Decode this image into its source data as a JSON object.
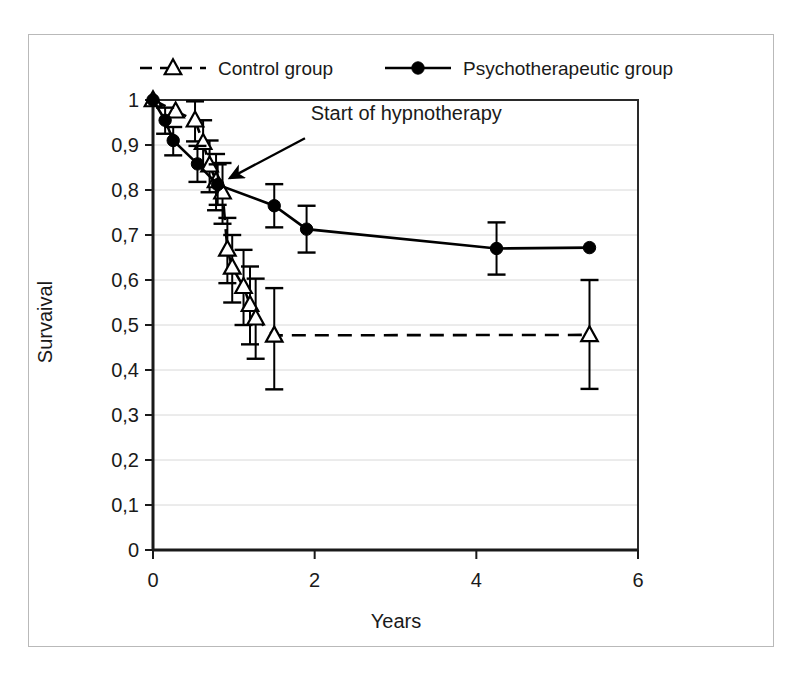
{
  "chart_data": {
    "type": "line",
    "title": "",
    "subtitle": "",
    "xlabel": "Years",
    "ylabel": "Survaival",
    "xlim": [
      0,
      6
    ],
    "ylim": [
      0,
      1
    ],
    "xticks": [
      0,
      2,
      4,
      6
    ],
    "xtick_labels": [
      "0",
      "2",
      "4",
      "6"
    ],
    "yticks": [
      0,
      0.1,
      0.2,
      0.3,
      0.4,
      0.5,
      0.6,
      0.7,
      0.8,
      0.9,
      1
    ],
    "ytick_labels": [
      "0",
      "0,1",
      "0,2",
      "0,3",
      "0,4",
      "0,5",
      "0,6",
      "0,7",
      "0,8",
      "0,9",
      "1"
    ],
    "grid": "horizontal",
    "legend_position": "top",
    "decimal_separator": ",",
    "annotations": [
      {
        "text": "Start of hypnotherapy",
        "text_x": 1.95,
        "text_y": 0.955,
        "arrow_from_x": 1.88,
        "arrow_from_y": 0.915,
        "arrow_to_x": 0.9,
        "arrow_to_y": 0.822
      }
    ],
    "series": [
      {
        "name": "Control group",
        "marker": "open-triangle",
        "line_style": "dashed",
        "color": "#000000",
        "points": [
          {
            "x": 0.0,
            "y": 1.0,
            "err_low": 0.0,
            "err_high": 0.0
          },
          {
            "x": 0.28,
            "y": 0.975,
            "err_low": 0.0,
            "err_high": 0.0
          },
          {
            "x": 0.52,
            "y": 0.955,
            "err_low": 0.047,
            "err_high": 0.042
          },
          {
            "x": 0.62,
            "y": 0.905,
            "err_low": 0.055,
            "err_high": 0.05
          },
          {
            "x": 0.7,
            "y": 0.855,
            "err_low": 0.06,
            "err_high": 0.055
          },
          {
            "x": 0.78,
            "y": 0.82,
            "err_low": 0.065,
            "err_high": 0.06
          },
          {
            "x": 0.86,
            "y": 0.795,
            "err_low": 0.07,
            "err_high": 0.065
          },
          {
            "x": 0.92,
            "y": 0.668,
            "err_low": 0.075,
            "err_high": 0.07
          },
          {
            "x": 0.98,
            "y": 0.628,
            "err_low": 0.078,
            "err_high": 0.072
          },
          {
            "x": 1.12,
            "y": 0.585,
            "err_low": 0.085,
            "err_high": 0.082
          },
          {
            "x": 1.2,
            "y": 0.545,
            "err_low": 0.088,
            "err_high": 0.085
          },
          {
            "x": 1.27,
            "y": 0.515,
            "err_low": 0.09,
            "err_high": 0.088
          },
          {
            "x": 1.5,
            "y": 0.477,
            "err_low": 0.12,
            "err_high": 0.105
          },
          {
            "x": 5.4,
            "y": 0.478,
            "err_low": 0.12,
            "err_high": 0.122
          }
        ]
      },
      {
        "name": "Psychotherapeutic group",
        "marker": "filled-circle",
        "line_style": "solid",
        "color": "#000000",
        "points": [
          {
            "x": 0.0,
            "y": 1.0,
            "err_low": 0.0,
            "err_high": 0.0
          },
          {
            "x": 0.15,
            "y": 0.955,
            "err_low": 0.03,
            "err_high": 0.028
          },
          {
            "x": 0.25,
            "y": 0.91,
            "err_low": 0.033,
            "err_high": 0.03
          },
          {
            "x": 0.55,
            "y": 0.858,
            "err_low": 0.04,
            "err_high": 0.04
          },
          {
            "x": 0.8,
            "y": 0.812,
            "err_low": 0.045,
            "err_high": 0.045
          },
          {
            "x": 1.5,
            "y": 0.765,
            "err_low": 0.048,
            "err_high": 0.048
          },
          {
            "x": 1.9,
            "y": 0.713,
            "err_low": 0.052,
            "err_high": 0.052
          },
          {
            "x": 4.25,
            "y": 0.67,
            "err_low": 0.058,
            "err_high": 0.058
          },
          {
            "x": 5.4,
            "y": 0.672,
            "err_low": 0.0,
            "err_high": 0.0
          }
        ]
      }
    ]
  },
  "legend": {
    "items": [
      {
        "label": "Control group",
        "marker": "open-triangle",
        "line_style": "dashed"
      },
      {
        "label": "Psychotherapeutic group",
        "marker": "filled-circle",
        "line_style": "solid"
      }
    ]
  },
  "axes": {
    "x_title": "Years",
    "y_title": "Survaival"
  }
}
